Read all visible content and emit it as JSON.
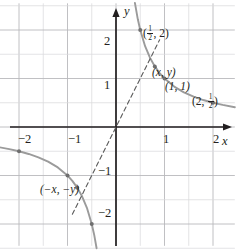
{
  "figure": {
    "kind": "cartesian-graph",
    "background": "#ffffff",
    "ink_color": "#231f20",
    "curve_color": "#9b9b9b",
    "grid_color": "#b9b9bc",
    "dash_color": "#5a5a5a"
  },
  "axes": {
    "x_label": "x",
    "y_label": "y",
    "x_ticks": [
      {
        "value": -2,
        "label": "−2"
      },
      {
        "value": -1,
        "label": "−1"
      },
      {
        "value": 1,
        "label": "1"
      },
      {
        "value": 2,
        "label": "2"
      }
    ],
    "y_ticks": [
      {
        "value": 2,
        "label": "2"
      },
      {
        "value": 1,
        "label": "1"
      },
      {
        "value": -1,
        "label": "−1"
      },
      {
        "value": -2,
        "label": "−2"
      }
    ],
    "xlim": [
      -2.55,
      2.45
    ],
    "ylim": [
      -2.45,
      2.55
    ],
    "grid": true,
    "grid_step": 0.5
  },
  "chart_data": {
    "type": "line",
    "title": "",
    "xlabel": "x",
    "ylabel": "y",
    "xlim": [
      -2.55,
      2.45
    ],
    "ylim": [
      -2.45,
      2.55
    ],
    "grid": true,
    "legend": "none",
    "series": [
      {
        "name": "y = 1/x (right branch)",
        "equation": "y = 1/x",
        "color": "#9b9b9b",
        "style": "solid",
        "x": [
          0.39,
          0.45,
          0.5,
          0.6,
          0.7,
          0.8,
          0.9,
          1.0,
          1.2,
          1.4,
          1.6,
          1.8,
          2.0,
          2.2,
          2.45
        ],
        "y": [
          2.56,
          2.22,
          2.0,
          1.667,
          1.429,
          1.25,
          1.111,
          1.0,
          0.833,
          0.714,
          0.625,
          0.556,
          0.5,
          0.455,
          0.408
        ]
      },
      {
        "name": "y = 1/x (left branch)",
        "equation": "y = 1/x",
        "color": "#9b9b9b",
        "style": "solid",
        "x": [
          -2.55,
          -2.2,
          -2.0,
          -1.8,
          -1.6,
          -1.4,
          -1.2,
          -1.0,
          -0.9,
          -0.8,
          -0.7,
          -0.6,
          -0.5,
          -0.45,
          -0.4
        ],
        "y": [
          -0.392,
          -0.455,
          -0.5,
          -0.556,
          -0.625,
          -0.714,
          -0.833,
          -1.0,
          -1.111,
          -1.25,
          -1.429,
          -1.667,
          -2.0,
          -2.22,
          -2.5
        ]
      },
      {
        "name": "symmetry line through origin",
        "color": "#5a5a5a",
        "style": "dashed",
        "x": [
          -0.9,
          0.9
        ],
        "y": [
          -1.8,
          1.8
        ]
      }
    ],
    "points": [
      {
        "name": "half-two",
        "x": 0.5,
        "y": 2.0,
        "label": "(1/2, 2)"
      },
      {
        "name": "xy",
        "x": 0.8,
        "y": 1.25,
        "label": "(x, y)"
      },
      {
        "name": "one-one",
        "x": 1.0,
        "y": 1.0,
        "label": "(1, 1)"
      },
      {
        "name": "two-half",
        "x": 2.0,
        "y": 0.5,
        "label": "(2, 1/2)"
      },
      {
        "name": "neg-two-half",
        "x": -2.0,
        "y": -0.5,
        "label": ""
      },
      {
        "name": "neg-one-one",
        "x": -1.0,
        "y": -1.0,
        "label": ""
      },
      {
        "name": "neg-xy",
        "x": -0.8,
        "y": -1.25,
        "label": "(−x, −y)"
      },
      {
        "name": "neg-half-two",
        "x": -0.5,
        "y": -2.0,
        "label": ""
      }
    ]
  },
  "annotations": {
    "point_half_two": {
      "open": "(",
      "num": "1",
      "den": "2",
      "rest": ", 2)"
    },
    "point_xy": "(x, y)",
    "point_one_one": "(1, 1)",
    "point_two_half": {
      "open": "(2, ",
      "num": "1",
      "den": "2",
      "rest": ")"
    },
    "point_neg_xy": "(−x, −y)"
  }
}
